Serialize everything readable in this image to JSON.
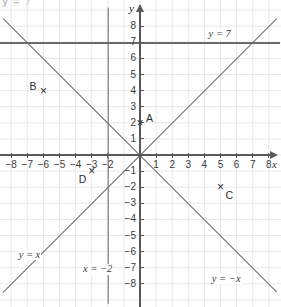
{
  "figure": {
    "kind": "coordinate-plane",
    "width": 281,
    "height": 307,
    "top_artifact_text": "y = 7",
    "background_color": "#ffffff",
    "grid_color": "#e6e6ea",
    "axis_color": "#58585a",
    "line_color": "#6a6a6d",
    "text_color": "#2f2f31"
  },
  "axes": {
    "x_label": "x",
    "y_label": "y",
    "x_min": -8,
    "x_max": 8,
    "y_min": -8,
    "y_max": 8,
    "unit_px": 16.1,
    "origin_px": {
      "x": 140,
      "y": 155
    },
    "x_tick_labels": [
      "−8",
      "−7",
      "−6",
      "−5",
      "−4",
      "−3",
      "−2",
      "1",
      "2",
      "3",
      "4",
      "5",
      "6",
      "7",
      "8"
    ],
    "x_tick_values": [
      -8,
      -7,
      -6,
      -5,
      -4,
      -3,
      -2,
      1,
      2,
      3,
      4,
      5,
      6,
      7,
      8
    ],
    "y_tick_labels": [
      "8",
      "7",
      "6",
      "5",
      "4",
      "3",
      "2",
      "1",
      "−1",
      "−2",
      "−3",
      "−4",
      "−5",
      "−6",
      "−7",
      "−8"
    ],
    "y_tick_values": [
      8,
      7,
      6,
      5,
      4,
      3,
      2,
      1,
      -1,
      -2,
      -3,
      -4,
      -5,
      -6,
      -7,
      -8
    ]
  },
  "chart_data": {
    "type": "line",
    "title": "",
    "xlabel": "x",
    "ylabel": "y",
    "xlim": [
      -8,
      8
    ],
    "ylim": [
      -8,
      8
    ],
    "grid": true,
    "legend": "inline-annotations",
    "series": [
      {
        "name": "y = x",
        "label": "y = x",
        "equation": "y = x",
        "slope": 1,
        "intercept": 0,
        "label_position": {
          "x": -7.6,
          "y": -6.2
        },
        "endpoints": [
          {
            "x": -8.5,
            "y": -8.5
          },
          {
            "x": 8.5,
            "y": 8.5
          }
        ]
      },
      {
        "name": "y = -x",
        "label": "y = −x",
        "equation": "y = -x",
        "slope": -1,
        "intercept": 0,
        "label_position": {
          "x": 4.4,
          "y": -7.7
        },
        "endpoints": [
          {
            "x": -8.5,
            "y": 8.5
          },
          {
            "x": 8.5,
            "y": -8.5
          }
        ]
      },
      {
        "name": "y = 7",
        "label": "y = 7",
        "equation": "y = 7",
        "slope": 0,
        "intercept": 7,
        "label_position": {
          "x": 4.2,
          "y": 7.5
        },
        "endpoints": [
          {
            "x": -8.7,
            "y": 7
          },
          {
            "x": 8.7,
            "y": 7
          }
        ]
      },
      {
        "name": "x = -2",
        "label": "x = −2",
        "equation": "x = -2",
        "vertical_at_x": -2,
        "label_position": {
          "x": -3.6,
          "y": -7.1
        },
        "endpoints": [
          {
            "x": -2,
            "y": 9.2
          },
          {
            "x": -2,
            "y": -9.2
          }
        ]
      }
    ],
    "points": [
      {
        "name": "A",
        "x": 0,
        "y": 2,
        "marker": "×",
        "label_offset": {
          "dx": 6,
          "dy": -10
        }
      },
      {
        "name": "B",
        "x": -6,
        "y": 4,
        "marker": "×",
        "label_offset": {
          "dx": -14,
          "dy": -10
        }
      },
      {
        "name": "C",
        "x": 5,
        "y": -2,
        "marker": "×",
        "label_offset": {
          "dx": 5,
          "dy": 3
        }
      },
      {
        "name": "D",
        "x": -3,
        "y": -1,
        "marker": "×",
        "label_offset": {
          "dx": -13,
          "dy": 3
        }
      }
    ]
  }
}
